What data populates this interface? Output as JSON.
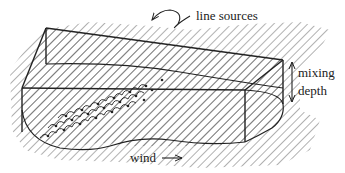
{
  "diagram": {
    "type": "3d-box-dispersion-schematic",
    "colors": {
      "ink": "#222222",
      "hatch": "#555555",
      "background": "#ffffff"
    },
    "labels": {
      "line_sources": "line sources",
      "mixing": "mixing",
      "depth": "depth",
      "wind": "wind"
    },
    "annotations": [
      {
        "name": "line-sources-pointer",
        "kind": "curly-arrow",
        "points_to": "line sources rows"
      },
      {
        "name": "mixing-depth-arrow",
        "kind": "double-arrow",
        "orientation": "vertical"
      },
      {
        "name": "wind-arrow",
        "kind": "arrow",
        "direction": "right"
      }
    ],
    "line_source_rows": 3
  }
}
